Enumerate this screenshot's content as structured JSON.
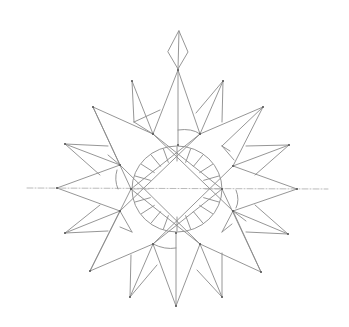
{
  "drawing": {
    "description": "Pencil sketch of a sixteen-point star / compass rose with a central circle of radial ticks and a diamond finial on top",
    "width": 349,
    "height": 327,
    "background": "#ffffff",
    "stroke_color": "#8a8a8a",
    "stroke_width": 0.9,
    "dashed_color": "#a8a8a8",
    "vertex_color": "#555555",
    "center": [
      177,
      189
    ],
    "horizontal_axis": {
      "x1": 27,
      "y1": 188,
      "x2": 328,
      "y2": 189
    },
    "finial": {
      "top": [
        179,
        31
      ],
      "left": [
        168,
        52
      ],
      "right": [
        188,
        52
      ],
      "bottom": [
        178,
        69
      ]
    },
    "circle": {
      "cx": 177,
      "cy": 189,
      "rx": 45,
      "ry": 43
    },
    "ticks": {
      "count": 20,
      "outer_r": 44,
      "inner_r": 28,
      "gap_angles": [
        0,
        180
      ]
    },
    "outer_tips": [
      [
        178,
        70
      ],
      [
        223,
        81
      ],
      [
        263,
        107
      ],
      [
        289,
        145
      ],
      [
        297,
        189
      ],
      [
        288,
        234
      ],
      [
        261,
        272
      ],
      [
        222,
        297
      ],
      [
        176,
        306
      ],
      [
        130,
        297
      ],
      [
        90,
        271
      ],
      [
        65,
        233
      ],
      [
        57,
        188
      ],
      [
        65,
        144
      ],
      [
        93,
        107
      ],
      [
        132,
        81
      ]
    ],
    "inner_vertices": [
      [
        178,
        145
      ],
      [
        200,
        134
      ],
      [
        233,
        166
      ],
      [
        222,
        189
      ],
      [
        233,
        211
      ],
      [
        200,
        244
      ],
      [
        176,
        233
      ],
      [
        153,
        244
      ],
      [
        120,
        211
      ],
      [
        131,
        189
      ],
      [
        120,
        165
      ],
      [
        153,
        134
      ]
    ],
    "lines": [
      [
        [
          178,
          70
        ],
        [
          153,
          134
        ]
      ],
      [
        [
          178,
          70
        ],
        [
          200,
          134
        ]
      ],
      [
        [
          178,
          70
        ],
        [
          178,
          145
        ]
      ],
      [
        [
          132,
          81
        ],
        [
          153,
          134
        ]
      ],
      [
        [
          132,
          81
        ],
        [
          134,
          122
        ]
      ],
      [
        [
          134,
          122
        ],
        [
          160,
          110
        ]
      ],
      [
        [
          223,
          81
        ],
        [
          200,
          134
        ]
      ],
      [
        [
          223,
          81
        ],
        [
          222,
          122
        ]
      ],
      [
        [
          223,
          81
        ],
        [
          196,
          113
        ]
      ],
      [
        [
          93,
          107
        ],
        [
          153,
          134
        ]
      ],
      [
        [
          93,
          107
        ],
        [
          120,
          165
        ]
      ],
      [
        [
          93,
          107
        ],
        [
          131,
          189
        ]
      ],
      [
        [
          263,
          107
        ],
        [
          200,
          134
        ]
      ],
      [
        [
          263,
          107
        ],
        [
          233,
          166
        ]
      ],
      [
        [
          263,
          107
        ],
        [
          222,
          146
        ]
      ],
      [
        [
          222,
          146
        ],
        [
          234,
          160
        ]
      ],
      [
        [
          65,
          144
        ],
        [
          120,
          165
        ]
      ],
      [
        [
          65,
          144
        ],
        [
          108,
          146
        ]
      ],
      [
        [
          65,
          144
        ],
        [
          100,
          175
        ]
      ],
      [
        [
          289,
          145
        ],
        [
          233,
          166
        ]
      ],
      [
        [
          289,
          145
        ],
        [
          246,
          146
        ]
      ],
      [
        [
          289,
          145
        ],
        [
          255,
          175
        ]
      ],
      [
        [
          57,
          188
        ],
        [
          120,
          165
        ]
      ],
      [
        [
          57,
          188
        ],
        [
          120,
          211
        ]
      ],
      [
        [
          297,
          189
        ],
        [
          233,
          166
        ]
      ],
      [
        [
          297,
          189
        ],
        [
          233,
          211
        ]
      ],
      [
        [
          65,
          233
        ],
        [
          120,
          211
        ]
      ],
      [
        [
          65,
          233
        ],
        [
          108,
          231
        ]
      ],
      [
        [
          65,
          233
        ],
        [
          100,
          205
        ]
      ],
      [
        [
          288,
          234
        ],
        [
          233,
          211
        ]
      ],
      [
        [
          288,
          234
        ],
        [
          246,
          232
        ]
      ],
      [
        [
          288,
          234
        ],
        [
          255,
          205
        ]
      ],
      [
        [
          90,
          271
        ],
        [
          153,
          244
        ]
      ],
      [
        [
          90,
          271
        ],
        [
          120,
          211
        ]
      ],
      [
        [
          90,
          271
        ],
        [
          131,
          189
        ]
      ],
      [
        [
          261,
          272
        ],
        [
          200,
          244
        ]
      ],
      [
        [
          261,
          272
        ],
        [
          233,
          211
        ]
      ],
      [
        [
          261,
          272
        ],
        [
          222,
          189
        ]
      ],
      [
        [
          130,
          297
        ],
        [
          153,
          244
        ]
      ],
      [
        [
          130,
          297
        ],
        [
          131,
          255
        ]
      ],
      [
        [
          130,
          297
        ],
        [
          157,
          265
        ]
      ],
      [
        [
          222,
          297
        ],
        [
          200,
          244
        ]
      ],
      [
        [
          222,
          297
        ],
        [
          222,
          253
        ]
      ],
      [
        [
          222,
          297
        ],
        [
          197,
          270
        ]
      ],
      [
        [
          176,
          306
        ],
        [
          153,
          244
        ]
      ],
      [
        [
          176,
          306
        ],
        [
          200,
          244
        ]
      ],
      [
        [
          176,
          306
        ],
        [
          176,
          233
        ]
      ],
      [
        [
          153,
          134
        ],
        [
          233,
          211
        ]
      ],
      [
        [
          200,
          134
        ],
        [
          120,
          211
        ]
      ],
      [
        [
          153,
          134
        ],
        [
          222,
          189
        ]
      ],
      [
        [
          200,
          134
        ],
        [
          131,
          189
        ]
      ],
      [
        [
          120,
          165
        ],
        [
          200,
          244
        ]
      ],
      [
        [
          233,
          166
        ],
        [
          153,
          244
        ]
      ],
      [
        [
          131,
          189
        ],
        [
          200,
          244
        ]
      ],
      [
        [
          222,
          189
        ],
        [
          153,
          244
        ]
      ],
      [
        [
          134,
          122
        ],
        [
          153,
          134
        ]
      ],
      [
        [
          120,
          227
        ],
        [
          132,
          232
        ]
      ],
      [
        [
          132,
          232
        ],
        [
          120,
          211
        ]
      ],
      [
        [
          230,
          151
        ],
        [
          222,
          146
        ]
      ],
      [
        [
          232,
          224
        ],
        [
          222,
          232
        ]
      ],
      [
        [
          222,
          232
        ],
        [
          233,
          211
        ]
      ],
      [
        [
          108,
          155
        ],
        [
          120,
          165
        ]
      ],
      [
        [
          246,
          221
        ],
        [
          233,
          211
        ]
      ]
    ],
    "inner_arcs": [
      {
        "d": "M178 130 Q192 128 200 134"
      },
      {
        "d": "M176 248 Q165 250 153 244"
      },
      {
        "d": "M117 170 Q114 180 118 189"
      },
      {
        "d": "M236 190 Q240 200 236 208"
      }
    ]
  }
}
